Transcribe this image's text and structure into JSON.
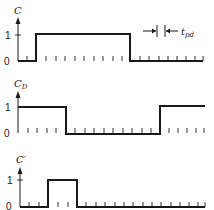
{
  "diagram": {
    "type": "timing-diagram",
    "panels": [
      {
        "id": "C",
        "label": "C",
        "label_sub": "",
        "y_levels": [
          "0",
          "1"
        ],
        "transitions_x": [
          36,
          130
        ],
        "initial_level": 0,
        "annotation": {
          "text": "t",
          "sub": "pd"
        }
      },
      {
        "id": "CD",
        "label": "C",
        "label_sub": "D",
        "y_levels": [
          "0",
          "1"
        ],
        "transitions_x": [
          66,
          160
        ],
        "initial_level": 1
      },
      {
        "id": "Cprime",
        "label": "C′",
        "label_sub": "",
        "y_levels": [
          "0",
          "1"
        ],
        "transitions_x": [
          48,
          77
        ],
        "initial_level": 0
      }
    ],
    "colors": {
      "ink": "#1a1a1a",
      "background": "#ffffff"
    }
  }
}
